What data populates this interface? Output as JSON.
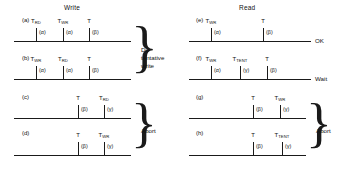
{
  "figure": {
    "columns": [
      {
        "id": "write",
        "title": "Write"
      },
      {
        "id": "read",
        "title": "Read"
      }
    ],
    "greek": {
      "alpha": "(α)",
      "beta": "(β)",
      "gamma": "(γ)"
    },
    "rows": [
      {
        "id": "a",
        "label": "(a)",
        "column": "write",
        "ticks": [
          {
            "name": "T",
            "sub": "RD",
            "ann": "(α)"
          },
          {
            "name": "T",
            "sub": "WR",
            "ann": "(α)"
          },
          {
            "name": "T",
            "sub": "",
            "ann": "(β)"
          }
        ],
        "end_label": ""
      },
      {
        "id": "b",
        "label": "(b)",
        "column": "write",
        "ticks": [
          {
            "name": "T",
            "sub": "WR",
            "ann": "(α)"
          },
          {
            "name": "T",
            "sub": "RD",
            "ann": "(α)"
          },
          {
            "name": "T",
            "sub": "",
            "ann": "(β)"
          }
        ],
        "end_label": ""
      },
      {
        "id": "c",
        "label": "(c)",
        "column": "write",
        "ticks": [
          {
            "name": "T",
            "sub": "",
            "ann": "(β)"
          },
          {
            "name": "T",
            "sub": "RD",
            "ann": "(γ)"
          }
        ],
        "end_label": ""
      },
      {
        "id": "d",
        "label": "(d)",
        "column": "write",
        "ticks": [
          {
            "name": "T",
            "sub": "",
            "ann": "(β)"
          },
          {
            "name": "T",
            "sub": "WR",
            "ann": "(γ)"
          }
        ],
        "end_label": ""
      },
      {
        "id": "e",
        "label": "(e)",
        "column": "read",
        "ticks": [
          {
            "name": "T",
            "sub": "WR",
            "ann": "(α)"
          },
          {
            "name": "T",
            "sub": "",
            "ann": "(β)"
          }
        ],
        "end_label": "OK"
      },
      {
        "id": "f",
        "label": "(f)",
        "column": "read",
        "ticks": [
          {
            "name": "T",
            "sub": "WR",
            "ann": "(α)"
          },
          {
            "name": "T",
            "sub": "TENT",
            "ann": "(γ)"
          },
          {
            "name": "T",
            "sub": "",
            "ann": "(β)"
          }
        ],
        "end_label": "Wait"
      },
      {
        "id": "g",
        "label": "(g)",
        "column": "read",
        "ticks": [
          {
            "name": "T",
            "sub": "",
            "ann": "(β)"
          },
          {
            "name": "T",
            "sub": "WR",
            "ann": "(γ)"
          }
        ],
        "end_label": ""
      },
      {
        "id": "h",
        "label": "(h)",
        "column": "read",
        "ticks": [
          {
            "name": "T",
            "sub": "",
            "ann": "(β)"
          },
          {
            "name": "T",
            "sub": "TENT",
            "ann": "(γ)"
          }
        ],
        "end_label": ""
      }
    ],
    "brackets": [
      {
        "id": "write-ab",
        "text": "Do\ntentative\nwrite",
        "rows": [
          "a",
          "b"
        ]
      },
      {
        "id": "write-cd",
        "text": "Abort",
        "rows": [
          "c",
          "d"
        ]
      },
      {
        "id": "read-gh",
        "text": "Abort",
        "rows": [
          "g",
          "h"
        ]
      }
    ]
  }
}
